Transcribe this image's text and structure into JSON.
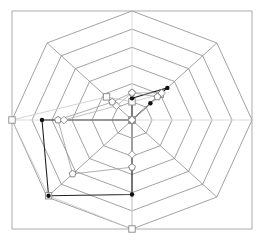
{
  "chart_data": {
    "type": "radar",
    "title": "",
    "axes": [
      "N",
      "NE",
      "E",
      "SE",
      "S",
      "SW",
      "W",
      "NW"
    ],
    "axis_labels_visible": false,
    "rings": 6,
    "range": [
      0,
      6
    ],
    "grid": true,
    "legend": null,
    "series": [
      {
        "name": "Series 1 (square)",
        "marker": "square",
        "color": "#c8c8c8",
        "values": [
          1.0,
          2.0,
          0,
          0,
          6.0,
          5.9,
          6.0,
          1.8
        ]
      },
      {
        "name": "Series 2 (dot)",
        "marker": "dot",
        "color": "#222222",
        "values": [
          1.2,
          2.5,
          0,
          0,
          4.1,
          5.9,
          4.5,
          0
        ]
      },
      {
        "name": "Series 3 (pentagon)",
        "marker": "pentagon",
        "color": "#9a9a9a",
        "values": [
          1.5,
          1.8,
          0,
          0,
          2.6,
          4.2,
          3.7,
          1.4
        ]
      },
      {
        "name": "Series 4 (diamond)",
        "marker": "diamond",
        "color": "#b0b0b0",
        "values": [
          1.5,
          2.1,
          0,
          0,
          1.9,
          0,
          3.4,
          1.1
        ]
      }
    ],
    "extra_points": [
      {
        "series": "Series 2 (dot)",
        "axis": "NE",
        "value": 1.3
      }
    ]
  },
  "layout": {
    "frame": {
      "x": 12,
      "y": 11,
      "w": 240,
      "h": 218
    },
    "center": {
      "x": 132,
      "y": 120
    },
    "radius_x": 120,
    "radius_y": 109,
    "grid_color": "#8a8a8a",
    "axis_color": "#d0d0d0",
    "frame_color": "#9a9a9a"
  }
}
